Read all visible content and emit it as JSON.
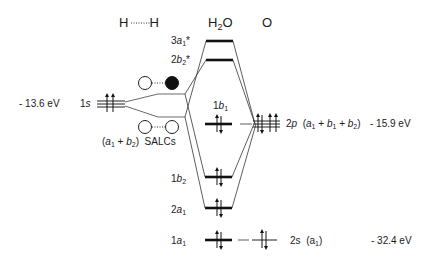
{
  "headers": {
    "h_h": "H",
    "h_h2": "H",
    "h2o": "H",
    "h2o_sub": "2",
    "h2o_o": "O",
    "o": "O"
  },
  "h_side": {
    "energy": "- 13.6 eV",
    "orbital_num": "1",
    "orbital_letter": "s",
    "salc_label_open": "(",
    "salc_a": "a",
    "salc_a_sub": "1",
    "salc_plus": " + ",
    "salc_b": "b",
    "salc_b_sub": "2",
    "salc_close": ")",
    "salc_text": "SALCs"
  },
  "mo_levels": [
    {
      "id": "3a1*",
      "num": "3",
      "letter": "a",
      "sub": "1",
      "star": "*",
      "electrons": 0
    },
    {
      "id": "2b2*",
      "num": "2",
      "letter": "b",
      "sub": "2",
      "star": "*",
      "electrons": 0
    },
    {
      "id": "1b1",
      "num": "1",
      "letter": "b",
      "sub": "1",
      "star": "",
      "electrons": 2
    },
    {
      "id": "1b2",
      "num": "1",
      "letter": "b",
      "sub": "2",
      "star": "",
      "electrons": 2
    },
    {
      "id": "2a1",
      "num": "2",
      "letter": "a",
      "sub": "1",
      "star": "",
      "electrons": 2
    },
    {
      "id": "1a1",
      "num": "1",
      "letter": "a",
      "sub": "1",
      "star": "",
      "electrons": 2
    }
  ],
  "o_side": {
    "p_num": "2",
    "p_letter": "p",
    "p_sym_open": "(",
    "p_a": "a",
    "p_a_sub": "1",
    "p_plus1": " + ",
    "p_b1": "b",
    "p_b1_sub": "1",
    "p_plus2": " + ",
    "p_b2": "b",
    "p_b2_sub": "2",
    "p_close": ")",
    "p_energy": "- 15.9 eV",
    "s_label": "2s",
    "s_sym_open": "(",
    "s_a": "a",
    "s_a_sub": "1",
    "s_close": ")",
    "s_energy": "- 32.4 eV"
  },
  "colors": {
    "line": "#1a1a1a",
    "thin_line": "#444444",
    "filled_orbital": "#111111"
  }
}
